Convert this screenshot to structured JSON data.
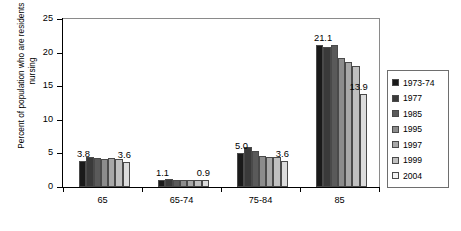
{
  "chart_data": {
    "type": "bar",
    "title": "",
    "xlabel": "",
    "ylabel": "Percent of population who are residents of nursing",
    "ylim": [
      0,
      25
    ],
    "yticks": [
      0,
      5,
      10,
      15,
      20,
      25
    ],
    "grid": false,
    "legend_position": "right",
    "categories": [
      "65",
      "65-74",
      "75-84",
      "85"
    ],
    "series": [
      {
        "name": "1973-74",
        "color": "#1a1a1a",
        "values": [
          3.8,
          1.1,
          5.0,
          21.1
        ]
      },
      {
        "name": "1977",
        "color": "#3a3a3a",
        "values": [
          4.4,
          1.2,
          5.9,
          20.9
        ]
      },
      {
        "name": "1985",
        "color": "#5a5a5a",
        "values": [
          4.3,
          1.0,
          5.3,
          21.1
        ]
      },
      {
        "name": "1995",
        "color": "#8c8c8c",
        "values": [
          4.2,
          1.0,
          4.6,
          19.2
        ]
      },
      {
        "name": "1997",
        "color": "#a8a8a8",
        "values": [
          4.3,
          1.0,
          4.5,
          18.6
        ]
      },
      {
        "name": "1999",
        "color": "#c0c0c0",
        "values": [
          4.2,
          1.0,
          4.4,
          18.0
        ]
      },
      {
        "name": "2004",
        "color": "#dcdcdc",
        "values": [
          3.7,
          1.1,
          3.9,
          13.9
        ]
      }
    ],
    "annotations": [
      {
        "text": "3.8",
        "group": "65",
        "series": "1973-74"
      },
      {
        "text": "3.6",
        "group": "65",
        "series": "2004"
      },
      {
        "text": "1.1",
        "group": "65-74",
        "series": "1973-74"
      },
      {
        "text": "0.9",
        "group": "65-74",
        "series": "2004"
      },
      {
        "text": "5.0",
        "group": "75-84",
        "series": "1973-74"
      },
      {
        "text": "3.6",
        "group": "75-84",
        "series": "2004"
      },
      {
        "text": "21.1",
        "group": "85",
        "series": "1973-74"
      },
      {
        "text": "13.9",
        "group": "85",
        "series": "2004"
      }
    ]
  },
  "axis": {
    "y_tick_labels": [
      "0",
      "5",
      "10",
      "15",
      "20",
      "25"
    ],
    "x_tick_labels": [
      "65",
      "65-74",
      "75-84",
      "85"
    ],
    "y_axis_title": "Percent of population who are residents of nursing"
  },
  "legend": {
    "items": [
      {
        "label": "1973-74",
        "color": "#1a1a1a"
      },
      {
        "label": "1977",
        "color": "#3a3a3a"
      },
      {
        "label": "1985",
        "color": "#5a5a5a"
      },
      {
        "label": "1995",
        "color": "#8c8c8c"
      },
      {
        "label": "1997",
        "color": "#a8a8a8"
      },
      {
        "label": "1999",
        "color": "#c0c0c0"
      },
      {
        "label": "2004",
        "color": "#f2f2f2"
      }
    ]
  }
}
